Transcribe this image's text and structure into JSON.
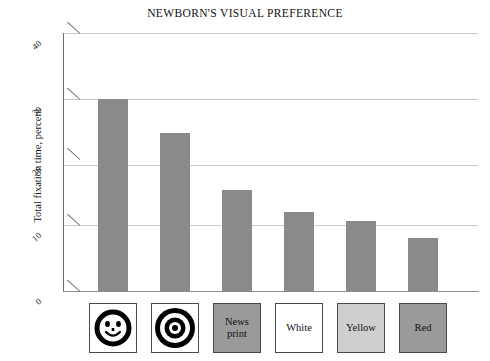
{
  "chart_data": {
    "type": "bar",
    "title": "NEWBORN'S VISUAL PREFERENCE",
    "xlabel": "",
    "ylabel": "Total fixation time, percent",
    "ylim": [
      0,
      40
    ],
    "yticks": [
      "0",
      "10",
      "20",
      "30",
      "40"
    ],
    "grid": true,
    "legend_position": "below-axis-swatches",
    "categories": [
      "Face",
      "Bullseye",
      "News print",
      "White",
      "Yellow",
      "Red"
    ],
    "values": [
      29.7,
      24.5,
      15.6,
      12.2,
      10.9,
      8.2
    ],
    "bar_color": "#8a8a8a",
    "swatches": [
      {
        "id": "face",
        "label": "",
        "icon": "smiley-face-icon",
        "fill": "#ffffff"
      },
      {
        "id": "bullseye",
        "label": "",
        "icon": "bullseye-icon",
        "fill": "#ffffff"
      },
      {
        "id": "newsprint",
        "label": "News\nprint",
        "icon": "",
        "fill": "#9a9a9a"
      },
      {
        "id": "white",
        "label": "White",
        "icon": "",
        "fill": "#ffffff"
      },
      {
        "id": "yellow",
        "label": "Yellow",
        "icon": "",
        "fill": "#cfcfcf"
      },
      {
        "id": "red",
        "label": "Red",
        "icon": "",
        "fill": "#9a9a9a"
      }
    ]
  },
  "axis": {
    "tick_0": "0",
    "tick_10": "10",
    "tick_20": "20",
    "tick_30": "30",
    "tick_40": "40",
    "y_title": "Total fixation time, percent"
  },
  "colors": {
    "bar": "#8a8a8a",
    "grid": "#c9c9c9",
    "axis": "#6b6b6b",
    "text": "#111111"
  }
}
